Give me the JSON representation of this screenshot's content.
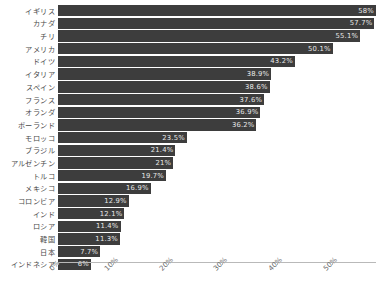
{
  "chart_data": {
    "type": "bar",
    "orientation": "horizontal",
    "title": "",
    "xlabel": "",
    "ylabel": "",
    "xlim": [
      0,
      58
    ],
    "grid": false,
    "legend": null,
    "axis_ticks": [
      "0%",
      "10%",
      "20%",
      "30%",
      "40%",
      "50%"
    ],
    "axis_tick_values": [
      0,
      10,
      20,
      30,
      40,
      50
    ],
    "categories": [
      "イギリス",
      "カナダ",
      "チリ",
      "アメリカ",
      "ドイツ",
      "イタリア",
      "スペイン",
      "フランス",
      "オランダ",
      "ポーランド",
      "モロッコ",
      "ブラジル",
      "アルゼンチン",
      "トルコ",
      "メキシコ",
      "コロンビア",
      "インド",
      "ロシア",
      "韓国",
      "日本",
      "インドネシア"
    ],
    "values": [
      58,
      57.7,
      55.1,
      50.1,
      43.2,
      38.9,
      38.6,
      37.6,
      36.9,
      36.2,
      23.5,
      21.4,
      21,
      19.7,
      16.9,
      12.9,
      12.1,
      11.4,
      11.3,
      7.7,
      6
    ],
    "data_labels": [
      "58%",
      "57.7%",
      "55.1%",
      "50.1%",
      "43.2%",
      "38.9%",
      "38.6%",
      "37.6%",
      "36.9%",
      "36.2%",
      "23.5%",
      "21.4%",
      "21%",
      "19.7%",
      "16.9%",
      "12.9%",
      "12.1%",
      "11.4%",
      "11.3%",
      "7.7%",
      "6%"
    ],
    "bar_color": "#3d3d3d",
    "label_color": "#e8e8e8"
  }
}
